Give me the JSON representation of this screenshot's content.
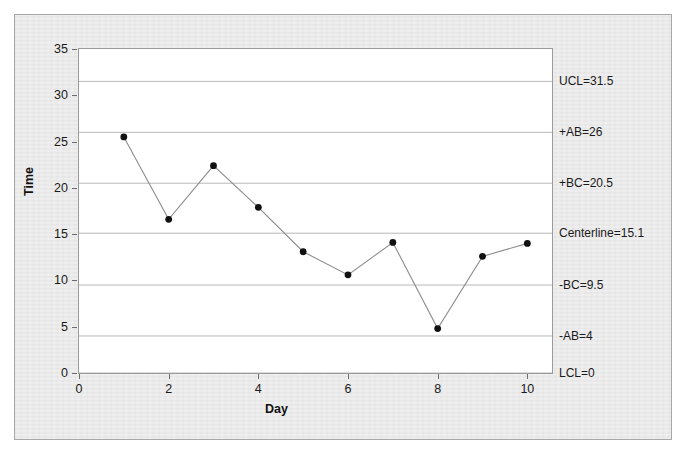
{
  "chart_data": {
    "type": "line",
    "title": "",
    "xlabel": "Day",
    "ylabel": "Time",
    "xlim": [
      0,
      10.55
    ],
    "ylim": [
      0,
      35
    ],
    "xticks": [
      0,
      2,
      4,
      6,
      8,
      10
    ],
    "yticks": [
      0,
      5,
      10,
      15,
      20,
      25,
      30,
      35
    ],
    "grid": "horizontal-control-limits-only",
    "legend": "none",
    "x": [
      1,
      2,
      3,
      4,
      5,
      6,
      7,
      8,
      9,
      10
    ],
    "values": [
      25.5,
      16.6,
      22.4,
      17.9,
      13.1,
      10.6,
      14.1,
      4.8,
      12.6,
      14.0
    ],
    "series": [
      {
        "name": "Time",
        "values": [
          25.5,
          16.6,
          22.4,
          17.9,
          13.1,
          10.6,
          14.1,
          4.8,
          12.6,
          14.0
        ]
      }
    ],
    "control_limits": [
      {
        "name": "UCL",
        "label": "UCL=31.5",
        "value": 31.5
      },
      {
        "name": "+AB",
        "label": "+AB=26",
        "value": 26
      },
      {
        "name": "+BC",
        "label": "+BC=20.5",
        "value": 20.5
      },
      {
        "name": "Centerline",
        "label": "Centerline=15.1",
        "value": 15.1
      },
      {
        "name": "-BC",
        "label": "-BC=9.5",
        "value": 9.5
      },
      {
        "name": "-AB",
        "label": "-AB=4",
        "value": 4
      },
      {
        "name": "LCL",
        "label": "LCL=0",
        "value": 0
      }
    ],
    "colors": {
      "line": "#8c8c8c",
      "marker": "#111111",
      "gridline": "#b9b9b9",
      "plot_background": "#ffffff",
      "panel_background": "#e9e9e9",
      "axis": "#9a9a9a",
      "text": "#1a1a1a"
    }
  },
  "axes": {
    "y_title": "Time",
    "x_title": "Day",
    "y_tick_labels": [
      "35",
      "30",
      "25",
      "20",
      "15",
      "10",
      "5",
      "0"
    ],
    "x_tick_labels": [
      "0",
      "2",
      "4",
      "6",
      "8",
      "10"
    ]
  }
}
